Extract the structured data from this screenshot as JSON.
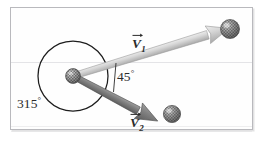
{
  "figure": {
    "type": "physics-vector-diagram",
    "caption": "",
    "background_color": "#fefefe",
    "frame_color": "#b9b9bd"
  },
  "labels": {
    "angle_reflex": "315",
    "angle_reflex_unit": "°",
    "angle_between": "45",
    "angle_between_unit": "°",
    "vector_1_symbol": "V",
    "vector_1_subscript": "1",
    "vector_2_symbol": "V",
    "vector_2_subscript": "2"
  },
  "elements": {
    "origin_ball_name": "textured-sphere-origin",
    "v1_tip_ball_name": "textured-sphere-v1-tip",
    "v2_tip_ball_name": "textured-sphere-v2-tip",
    "circle_name": "reference-circle",
    "v1_color": "#c9c9c9",
    "v2_color": "#7d7d7d",
    "circle_color": "#1d1d1d",
    "ball_color": "#8c8c8c"
  },
  "geometry": {
    "origin_x": 73,
    "origin_y": 76,
    "circle_radius": 35,
    "v1_tip_x": 228,
    "v1_tip_y": 28,
    "v2_tip_x": 168,
    "v2_tip_y": 113,
    "v1_angle_deg": 17,
    "v2_angle_deg": -28,
    "angle_between_deg": 45,
    "reflex_angle_deg": 315
  }
}
